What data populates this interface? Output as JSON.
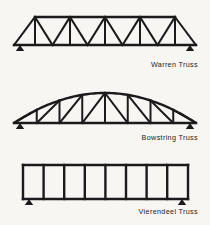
{
  "page": {
    "background_color": "#f7f6f3",
    "ink_color": "#1b1b1b"
  },
  "figures": [
    {
      "id": "warren",
      "caption": "Warren Truss",
      "description": "Warren truss with alternating diagonals and verticals",
      "geometry": {
        "bottom_chord": {
          "x1": 14,
          "y1": 45,
          "x2": 196,
          "y2": 45
        },
        "top_chord": {
          "x1": 35,
          "y1": 17,
          "x2": 175,
          "y2": 17
        },
        "panel_count": 8,
        "support_left_x": 20,
        "support_right_x": 190,
        "support_y": 45,
        "top_nodes_x": [
          35,
          52.5,
          70,
          87.5,
          105,
          122.5,
          140,
          157.5,
          175
        ],
        "bottom_nodes_x": [
          35,
          52.5,
          70,
          87.5,
          105,
          122.5,
          140,
          157.5,
          175
        ],
        "verticals_x": [
          35,
          70,
          105,
          140,
          175
        ],
        "diagonals": [
          {
            "x1": 14,
            "y1": 45,
            "x2": 35,
            "y2": 17
          },
          {
            "x1": 35,
            "y1": 17,
            "x2": 52.5,
            "y2": 45
          },
          {
            "x1": 52.5,
            "y1": 45,
            "x2": 70,
            "y2": 17
          },
          {
            "x1": 70,
            "y1": 17,
            "x2": 87.5,
            "y2": 45
          },
          {
            "x1": 87.5,
            "y1": 45,
            "x2": 105,
            "y2": 17
          },
          {
            "x1": 105,
            "y1": 17,
            "x2": 122.5,
            "y2": 45
          },
          {
            "x1": 122.5,
            "y1": 45,
            "x2": 140,
            "y2": 17
          },
          {
            "x1": 140,
            "y1": 17,
            "x2": 157.5,
            "y2": 45
          },
          {
            "x1": 157.5,
            "y1": 45,
            "x2": 175,
            "y2": 17
          },
          {
            "x1": 175,
            "y1": 17,
            "x2": 196,
            "y2": 45
          }
        ]
      }
    },
    {
      "id": "bowstring",
      "caption": "Bowstring Truss",
      "description": "Bowstring truss with curved arched top chord",
      "geometry": {
        "bottom_chord": {
          "x1": 14,
          "y1": 48,
          "x2": 196,
          "y2": 48
        },
        "arc_rise": 30,
        "arc_left_x": 14,
        "arc_right_x": 196,
        "panel_count": 8,
        "support_left_x": 20,
        "support_right_x": 190,
        "support_y": 48,
        "node_x": [
          14,
          36.75,
          59.5,
          82.25,
          105,
          127.75,
          150.5,
          173.25,
          196
        ]
      }
    },
    {
      "id": "vierendeel",
      "caption": "Vierendeel Truss",
      "description": "Vierendeel truss with rectangular panels and no diagonals",
      "geometry": {
        "top_chord": {
          "x1": 23,
          "y1": 15,
          "x2": 188,
          "y2": 15
        },
        "bottom_chord": {
          "x1": 23,
          "y1": 49,
          "x2": 188,
          "y2": 49
        },
        "panel_count": 8,
        "verticals_x": [
          23,
          43.6,
          64.2,
          84.8,
          105.4,
          126,
          146.6,
          167.2,
          188
        ],
        "support_left_x": 29,
        "support_right_x": 182,
        "support_y": 49
      }
    }
  ]
}
